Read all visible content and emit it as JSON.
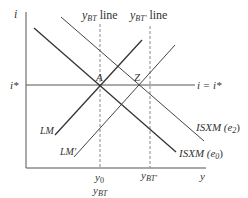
{
  "diagram": {
    "type": "economics-diagram",
    "axes": {
      "y_label": "i",
      "x_label": "y"
    },
    "interest_level": {
      "axis_label": "i*",
      "line_label": "i = i*"
    },
    "vertical_lines": [
      {
        "top_label_main": "y",
        "top_label_sub": "BT",
        "top_label_suffix": " line",
        "bottom_label_main": "y",
        "bottom_label_sub": "BT"
      },
      {
        "top_label_main": "y",
        "top_label_sub": "BT'",
        "top_label_suffix": " line",
        "bottom_label_main": "y",
        "bottom_label_sub": "BT'"
      }
    ],
    "y0_label": {
      "main": "y",
      "sub": "0"
    },
    "points": [
      {
        "label": "A"
      },
      {
        "label": "Z"
      }
    ],
    "curves": {
      "lm": "LM",
      "lm_prime": "LM'",
      "isxm_e0": {
        "main": "ISXM (e",
        "sub": "0",
        "end": ")"
      },
      "isxm_e2": {
        "main": "ISXM (e",
        "sub": "2",
        "end": ")"
      }
    },
    "colors": {
      "axis": "#555555",
      "line": "#333333",
      "dashed": "#888888"
    }
  }
}
